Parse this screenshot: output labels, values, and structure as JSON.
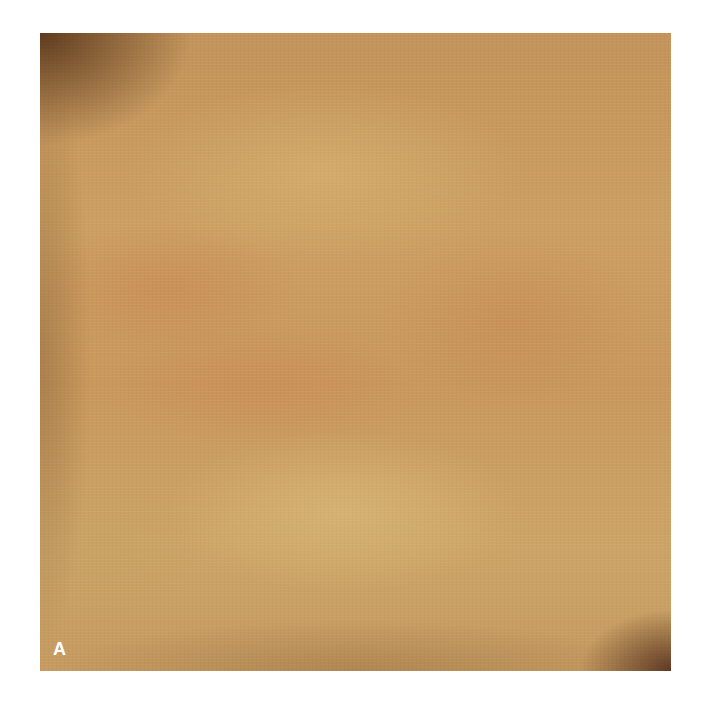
{
  "figure": {
    "panel_label": "A",
    "colors": {
      "skin_base": "#c89a5c",
      "highlight": "#d6b06e",
      "reddish_patch": "#c8824f",
      "corner_shadow": "#3c1e0a",
      "background": "#ffffff",
      "label": "#ffffff"
    }
  }
}
